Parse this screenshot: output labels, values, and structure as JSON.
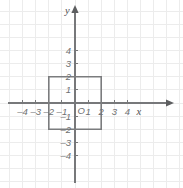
{
  "figure": {
    "background_color": "#ffffff",
    "width": 183,
    "height": 188
  },
  "chart_data": {
    "type": "scatter",
    "title": "",
    "xlabel": "x",
    "ylabel": "y",
    "xlim": [
      -4.9,
      4.9
    ],
    "ylim": [
      -4.6,
      4.9
    ],
    "grid": true,
    "grid_spacing": 1,
    "grid_color": "#ececec",
    "axis_color": "#77787a",
    "legend": "none",
    "origin_label": "O",
    "xticks": [
      -4,
      -3,
      -2,
      -1,
      1,
      2,
      3,
      4
    ],
    "xticklabels": [
      "–4",
      "–3",
      "–2",
      "–1",
      "1",
      "2",
      "3",
      "4"
    ],
    "yticks": [
      4,
      3,
      2,
      1,
      -1,
      -2,
      -3,
      -4
    ],
    "yticklabels": [
      "4",
      "3",
      "2",
      "1",
      "–1",
      "–2",
      "–3",
      "–4"
    ],
    "shapes": [
      {
        "name": "square",
        "type": "polygon",
        "closed": true,
        "stroke": "#7b7c7e",
        "fill": "none",
        "vertices": [
          {
            "x": -2,
            "y": 2
          },
          {
            "x": 2,
            "y": 2
          },
          {
            "x": 2,
            "y": -2
          },
          {
            "x": -2,
            "y": -2
          }
        ],
        "side_length": 4,
        "center": {
          "x": 0,
          "y": 0
        }
      }
    ],
    "axis_arrows": {
      "x_positive": true,
      "y_positive": true
    }
  },
  "labels": {
    "x_axis_name": "x",
    "y_axis_name": "y"
  }
}
